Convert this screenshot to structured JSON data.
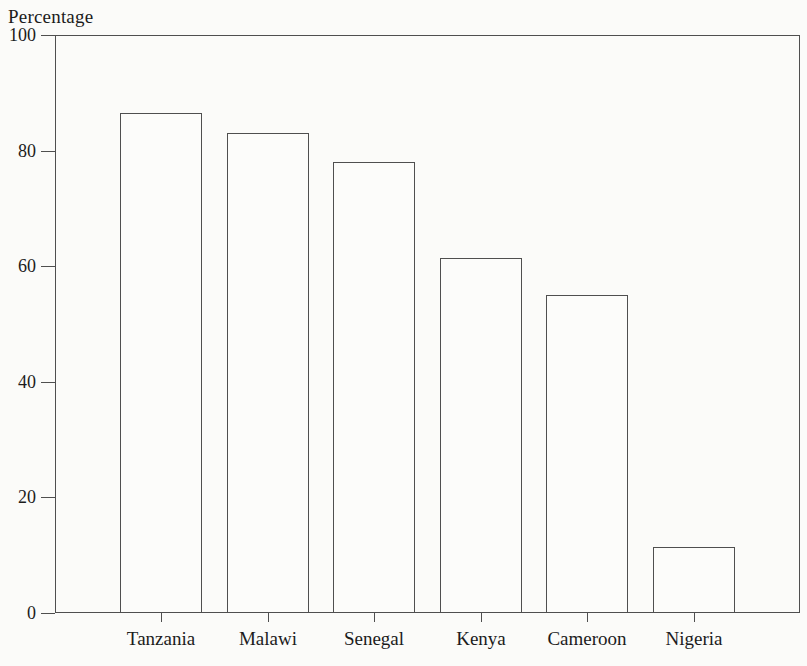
{
  "chart_data": {
    "type": "bar",
    "title": "",
    "ylabel": "Percentage",
    "xlabel": "",
    "categories": [
      "Tanzania",
      "Malawi",
      "Senegal",
      "Kenya",
      "Cameroon",
      "Nigeria"
    ],
    "values": [
      86.5,
      83,
      78,
      61.5,
      55,
      11.5
    ],
    "ylim": [
      0,
      100
    ],
    "yticks": [
      0,
      20,
      40,
      60,
      80,
      100
    ],
    "grid": false,
    "legend": false,
    "bar_fill": "#fcfcfa",
    "line_color": "#4f4f4f",
    "text_color": "#1c1c1c"
  }
}
